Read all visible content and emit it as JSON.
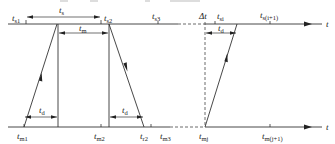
{
  "diagram": {
    "type": "timing-diagram",
    "top_axis": {
      "label": "t",
      "ticks": [
        {
          "name": "t",
          "sub": "s1"
        },
        {
          "name": "t",
          "sub": "s2"
        },
        {
          "name": "t",
          "sub": "s3"
        },
        {
          "name": "t",
          "sub": "si"
        },
        {
          "name": "t",
          "sub": "s(i+1)"
        }
      ]
    },
    "bottom_axis": {
      "label": "t",
      "ticks": [
        {
          "name": "t",
          "sub": "m1"
        },
        {
          "name": "t",
          "sub": "m2"
        },
        {
          "name": "t",
          "sub": "r2"
        },
        {
          "name": "t",
          "sub": "m3"
        },
        {
          "name": "t",
          "sub": "mj"
        },
        {
          "name": "t",
          "sub": "m(j+1)"
        }
      ]
    },
    "dimensions": {
      "ts": {
        "name": "t",
        "sub": "s"
      },
      "tm": {
        "name": "t",
        "sub": "m"
      },
      "td_left": {
        "name": "t",
        "sub": "d"
      },
      "td_mid": {
        "name": "t",
        "sub": "d"
      },
      "td_right": {
        "name": "t",
        "sub": "d"
      },
      "delta_t": "Δt"
    }
  }
}
